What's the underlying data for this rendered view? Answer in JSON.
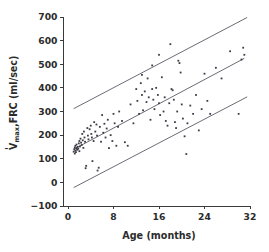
{
  "figure": {
    "background_color": "#ffffff",
    "point_color": "#3c3c46",
    "line_color": "#5a5a66",
    "axis_color": "#3a3a3a",
    "text_color": "#2b2b2b"
  },
  "axis_labels": {
    "y_main": "V",
    "y_dot": "̇",
    "y_sub": "max",
    "y_rest": ",FRC (ml/sec)",
    "y_full": "V̇max,FRC (ml/sec)",
    "x_full": "Age (months)"
  },
  "chart_data": {
    "type": "scatter",
    "title": "",
    "xlabel": "Age (months)",
    "ylabel": "V̇max,FRC (ml/sec)",
    "xlim": [
      0,
      32
    ],
    "ylim": [
      -100,
      700
    ],
    "xticks": [
      0,
      8,
      16,
      24,
      32
    ],
    "yticks": [
      -100,
      0,
      100,
      200,
      300,
      400,
      500,
      600,
      700
    ],
    "xtick_labels": [
      "0",
      "8",
      "16",
      "24",
      "32"
    ],
    "ytick_labels": [
      "-100",
      "0",
      "100",
      "200",
      "300",
      "400",
      "500",
      "600",
      "700"
    ],
    "grid": false,
    "legend": null,
    "series": [
      {
        "name": "V'max,FRC measurements",
        "marker": "square",
        "points": [
          [
            1.0,
            130
          ],
          [
            1.1,
            140
          ],
          [
            1.2,
            148
          ],
          [
            1.2,
            122
          ],
          [
            1.3,
            155
          ],
          [
            1.3,
            135
          ],
          [
            1.4,
            128
          ],
          [
            1.5,
            145
          ],
          [
            1.5,
            160
          ],
          [
            1.6,
            138
          ],
          [
            1.7,
            150
          ],
          [
            1.8,
            142
          ],
          [
            1.9,
            165
          ],
          [
            2.0,
            132
          ],
          [
            2.0,
            175
          ],
          [
            2.1,
            152
          ],
          [
            2.2,
            185
          ],
          [
            2.3,
            168
          ],
          [
            2.4,
            158
          ],
          [
            2.5,
            205
          ],
          [
            2.6,
            178
          ],
          [
            2.7,
            146
          ],
          [
            2.8,
            215
          ],
          [
            2.9,
            190
          ],
          [
            3.0,
            172
          ],
          [
            3.1,
            60
          ],
          [
            3.2,
            70
          ],
          [
            3.4,
            230
          ],
          [
            3.5,
            198
          ],
          [
            3.6,
            182
          ],
          [
            3.8,
            225
          ],
          [
            4.0,
            240
          ],
          [
            4.1,
            205
          ],
          [
            4.2,
            190
          ],
          [
            4.3,
            90
          ],
          [
            4.5,
            175
          ],
          [
            4.6,
            255
          ],
          [
            4.8,
            215
          ],
          [
            5.0,
            245
          ],
          [
            5.1,
            198
          ],
          [
            5.2,
            50
          ],
          [
            5.4,
            62
          ],
          [
            5.6,
            235
          ],
          [
            5.8,
            172
          ],
          [
            6.0,
            285
          ],
          [
            6.2,
            210
          ],
          [
            6.4,
            248
          ],
          [
            6.6,
            190
          ],
          [
            6.8,
            228
          ],
          [
            7.0,
            265
          ],
          [
            7.2,
            145
          ],
          [
            7.5,
            200
          ],
          [
            7.8,
            175
          ],
          [
            8.0,
            290
          ],
          [
            8.2,
            250
          ],
          [
            8.5,
            155
          ],
          [
            8.8,
            235
          ],
          [
            9.0,
            300
          ],
          [
            9.5,
            260
          ],
          [
            10.0,
            170
          ],
          [
            10.5,
            155
          ],
          [
            11.0,
            330
          ],
          [
            11.5,
            250
          ],
          [
            12.0,
            395
          ],
          [
            12.2,
            345
          ],
          [
            12.5,
            290
          ],
          [
            12.8,
            420
          ],
          [
            13.0,
            370
          ],
          [
            13.2,
            305
          ],
          [
            13.5,
            385
          ],
          [
            13.8,
            340
          ],
          [
            14.0,
            440
          ],
          [
            14.2,
            360
          ],
          [
            14.5,
            265
          ],
          [
            14.8,
            395
          ],
          [
            15.0,
            350
          ],
          [
            15.2,
            310
          ],
          [
            15.5,
            400
          ],
          [
            15.8,
            370
          ],
          [
            16.0,
            335
          ],
          [
            16.2,
            285
          ],
          [
            16.5,
            445
          ],
          [
            16.8,
            300
          ],
          [
            17.0,
            360
          ],
          [
            17.2,
            260
          ],
          [
            17.5,
            240
          ],
          [
            17.8,
            335
          ],
          [
            18.0,
            585
          ],
          [
            18.2,
            395
          ],
          [
            18.4,
            390
          ],
          [
            18.6,
            350
          ],
          [
            18.8,
            255
          ],
          [
            19.0,
            230
          ],
          [
            19.2,
            300
          ],
          [
            19.4,
            515
          ],
          [
            19.6,
            505
          ],
          [
            19.8,
            465
          ],
          [
            20.0,
            330
          ],
          [
            20.2,
            270
          ],
          [
            20.5,
            195
          ],
          [
            20.8,
            120
          ],
          [
            21.0,
            250
          ],
          [
            21.5,
            325
          ],
          [
            22.0,
            290
          ],
          [
            22.5,
            370
          ],
          [
            23.0,
            220
          ],
          [
            23.5,
            310
          ],
          [
            24.0,
            460
          ],
          [
            24.5,
            345
          ],
          [
            25.0,
            290
          ],
          [
            26.0,
            485
          ],
          [
            27.0,
            440
          ],
          [
            28.5,
            555
          ],
          [
            30.0,
            290
          ],
          [
            30.5,
            520
          ],
          [
            30.8,
            570
          ],
          [
            31.0,
            540
          ],
          [
            16.0,
            540
          ],
          [
            14.8,
            495
          ],
          [
            13.0,
            455
          ]
        ]
      }
    ],
    "reference_lines": [
      {
        "name": "upper-limit-line",
        "x1": 1.0,
        "y1": 312,
        "x2": 31.5,
        "y2": 698
      },
      {
        "name": "mean-regression-line",
        "x1": 1.0,
        "y1": 140,
        "x2": 31.0,
        "y2": 525
      },
      {
        "name": "lower-limit-line",
        "x1": 1.0,
        "y1": -22,
        "x2": 31.5,
        "y2": 362
      }
    ]
  }
}
